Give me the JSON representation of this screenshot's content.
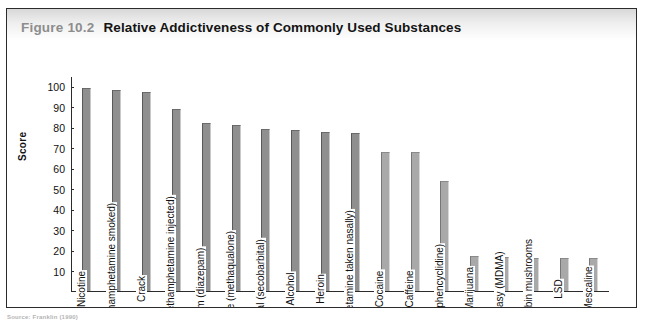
{
  "figure": {
    "number": "Figure 10.2",
    "title": "Relative Addictiveness of Commonly Used Substances",
    "source": "Source: Franklin (1990)"
  },
  "chart_data": {
    "type": "bar",
    "title": "Relative Addictiveness of Commonly Used Substances",
    "xlabel": "",
    "ylabel": "Score",
    "ylim": [
      0,
      105
    ],
    "grid": false,
    "legend": "none",
    "yticks": [
      10,
      20,
      30,
      40,
      50,
      60,
      70,
      80,
      90,
      100
    ],
    "categories": [
      "Nicotine",
      "Ice, glass (methamphetamine smoked)",
      "Crack",
      "Crystal meth (methamphetamine injected)",
      "Valium (diazepam)",
      "Quaalude (methaqualone)",
      "Seconal (secobarbital)",
      "Alcohol",
      "Heroin",
      "Crank (amphetamine taken nasally)",
      "Cocaine",
      "Caffeine",
      "PCP (phencyclidine)",
      "Marijuana",
      "Ecstasy (MDMA)",
      "Psilocybin mushrooms",
      "LSD",
      "Mescaline"
    ],
    "values": [
      99,
      98,
      97,
      89,
      82,
      81,
      79,
      78.5,
      77.5,
      77,
      68,
      68,
      53.5,
      17,
      16.5,
      16,
      16,
      16
    ]
  },
  "colors": {
    "bar_fill": "#8f8f8f",
    "bar_fill_light": "#a9a9a9",
    "axis": "#2b2b2b",
    "figure_number": "#8d8d8d",
    "title": "#141414"
  }
}
